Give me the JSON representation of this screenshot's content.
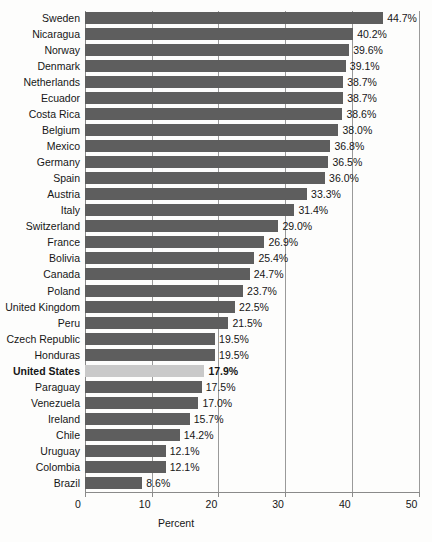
{
  "chart_data": {
    "type": "bar",
    "orientation": "horizontal",
    "title": "",
    "xlabel": "Percent",
    "ylabel": "",
    "xlim": [
      0,
      50
    ],
    "xticks": [
      0,
      10,
      20,
      30,
      40,
      50
    ],
    "xtick_labels": [
      "0",
      "10",
      "20",
      "30",
      "40",
      "50"
    ],
    "grid": true,
    "legend": "none",
    "value_suffix": "%",
    "highlight_category": "United States",
    "colors": {
      "bar": "#5e5e5e",
      "bar_highlight": "#c9c9c9",
      "gridline": "#9a9a9a",
      "axis": "#8a8a8a",
      "text": "#161616",
      "background": "#fdfdfc"
    },
    "categories": [
      "Sweden",
      "Nicaragua",
      "Norway",
      "Denmark",
      "Netherlands",
      "Ecuador",
      "Costa Rica",
      "Belgium",
      "Mexico",
      "Germany",
      "Spain",
      "Austria",
      "Italy",
      "Switzerland",
      "France",
      "Bolivia",
      "Canada",
      "Poland",
      "United Kingdom",
      "Peru",
      "Czech Republic",
      "Honduras",
      "United States",
      "Paraguay",
      "Venezuela",
      "Ireland",
      "Chile",
      "Uruguay",
      "Colombia",
      "Brazil"
    ],
    "values": [
      44.7,
      40.2,
      39.6,
      39.1,
      38.7,
      38.7,
      38.6,
      38.0,
      36.8,
      36.5,
      36.0,
      33.3,
      31.4,
      29.0,
      26.9,
      25.4,
      24.7,
      23.7,
      22.5,
      21.5,
      19.5,
      19.5,
      17.9,
      17.5,
      17.0,
      15.7,
      14.2,
      12.1,
      12.1,
      8.6
    ],
    "value_labels": [
      "44.7%",
      "40.2%",
      "39.6%",
      "39.1%",
      "38.7%",
      "38.7%",
      "38.6%",
      "38.0%",
      "36.8%",
      "36.5%",
      "36.0%",
      "33.3%",
      "31.4%",
      "29.0%",
      "26.9%",
      "25.4%",
      "24.7%",
      "23.7%",
      "22.5%",
      "21.5%",
      "19.5%",
      "19.5%",
      "17.9%",
      "17.5%",
      "17.0%",
      "15.7%",
      "14.2%",
      "12.1%",
      "12.1%",
      "8.6%"
    ]
  },
  "axis": {
    "x_title": "Percent"
  },
  "title_strip": {
    "text": ""
  }
}
